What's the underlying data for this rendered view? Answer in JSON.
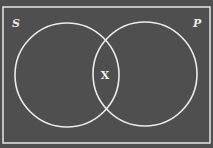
{
  "diagram": {
    "type": "venn",
    "background_color": "#4f4f4f",
    "line_color": "#e6e6e6",
    "universe": {
      "x": 3,
      "y": 7,
      "width": 207,
      "height": 136
    },
    "sets": [
      {
        "label": "S",
        "cx": 67,
        "cy": 75,
        "r": 52,
        "label_x": 12,
        "label_y": 27
      },
      {
        "label": "P",
        "cx": 145,
        "cy": 74,
        "r": 52,
        "label_x": 193,
        "label_y": 27
      }
    ],
    "intersection_mark": {
      "label": "X",
      "x": 105,
      "y": 79
    }
  }
}
